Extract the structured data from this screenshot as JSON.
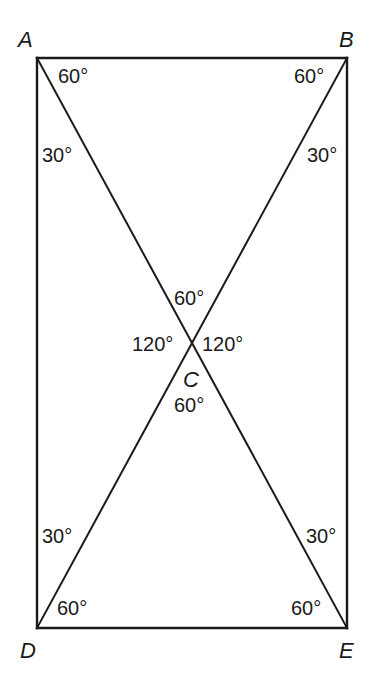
{
  "diagram": {
    "type": "geometry",
    "vertices": [
      {
        "name": "A",
        "label": "A",
        "x": 37,
        "y": 58
      },
      {
        "name": "B",
        "label": "B",
        "x": 347,
        "y": 58
      },
      {
        "name": "D",
        "label": "D",
        "x": 37,
        "y": 628
      },
      {
        "name": "E",
        "label": "E",
        "x": 347,
        "y": 628
      },
      {
        "name": "C",
        "label": "C",
        "x": 192,
        "y": 343
      }
    ],
    "edges": [
      {
        "from": "A",
        "to": "B",
        "kind": "side"
      },
      {
        "from": "B",
        "to": "E",
        "kind": "side"
      },
      {
        "from": "E",
        "to": "D",
        "kind": "side"
      },
      {
        "from": "D",
        "to": "A",
        "kind": "side"
      },
      {
        "from": "A",
        "to": "E",
        "kind": "diagonal"
      },
      {
        "from": "B",
        "to": "D",
        "kind": "diagonal"
      }
    ],
    "angles": [
      {
        "id": "A-top",
        "vertex": "A",
        "label": "60°",
        "x": 58,
        "y": 83
      },
      {
        "id": "A-side",
        "vertex": "A",
        "label": "30°",
        "x": 42,
        "y": 162
      },
      {
        "id": "B-top",
        "vertex": "B",
        "label": "60°",
        "x": 294,
        "y": 83
      },
      {
        "id": "B-side",
        "vertex": "B",
        "label": "30°",
        "x": 307,
        "y": 162
      },
      {
        "id": "C-top",
        "vertex": "C",
        "label": "60°",
        "x": 174,
        "y": 305
      },
      {
        "id": "C-left",
        "vertex": "C",
        "label": "120°",
        "x": 132,
        "y": 351
      },
      {
        "id": "C-right",
        "vertex": "C",
        "label": "120°",
        "x": 202,
        "y": 351
      },
      {
        "id": "C-bottom",
        "vertex": "C",
        "label": "60°",
        "x": 174,
        "y": 412
      },
      {
        "id": "D-side",
        "vertex": "D",
        "label": "30°",
        "x": 42,
        "y": 543
      },
      {
        "id": "D-bottom",
        "vertex": "D",
        "label": "60°",
        "x": 57,
        "y": 615
      },
      {
        "id": "E-side",
        "vertex": "E",
        "label": "30°",
        "x": 306,
        "y": 543
      },
      {
        "id": "E-bottom",
        "vertex": "E",
        "label": "60°",
        "x": 291,
        "y": 615
      }
    ],
    "vertex_label_positions": {
      "A": {
        "x": 18,
        "y": 47
      },
      "B": {
        "x": 339,
        "y": 47
      },
      "C": {
        "x": 183,
        "y": 387
      },
      "D": {
        "x": 20,
        "y": 658
      },
      "E": {
        "x": 339,
        "y": 658
      }
    },
    "colors": {
      "stroke": "#1a1a1a",
      "background": "#ffffff"
    }
  }
}
